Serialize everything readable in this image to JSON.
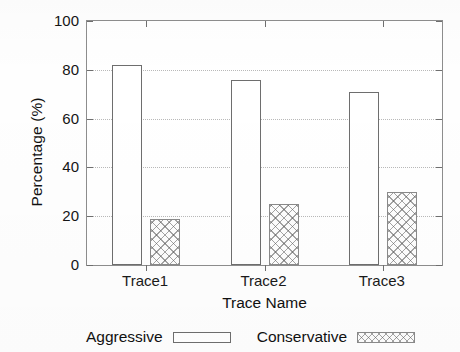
{
  "chart_data": {
    "type": "bar",
    "title": "",
    "xlabel": "Trace Name",
    "ylabel": "Percentage (%)",
    "categories": [
      "Trace1",
      "Trace2",
      "Trace3"
    ],
    "series": [
      {
        "name": "Aggressive",
        "values": [
          82,
          76,
          71
        ],
        "fill": "empty",
        "color": "#ffffff"
      },
      {
        "name": "Conservative",
        "values": [
          19,
          25,
          30
        ],
        "fill": "crosshatch",
        "color": "#9a9a9a"
      }
    ],
    "ylim": [
      0,
      100
    ],
    "yticks": [
      0,
      20,
      40,
      60,
      80,
      100
    ],
    "ytick_labels": [
      "0",
      "20",
      "40",
      "60",
      "80",
      "100"
    ],
    "grid": true,
    "grid_axis": "y",
    "grid_style": "dotted",
    "legend_position": "bottom"
  },
  "axes": {
    "y_title": "Percentage (%)",
    "x_title": "Trace Name"
  },
  "legend": {
    "entries": [
      {
        "label": "Aggressive",
        "swatch": "empty-rect-swatch"
      },
      {
        "label": "Conservative",
        "swatch": "crosshatch-rect-swatch"
      }
    ]
  }
}
